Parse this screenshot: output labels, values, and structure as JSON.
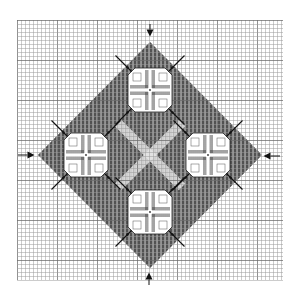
{
  "title": "Needlepoint stitch chart — diamond of four cross motifs",
  "canvas": {
    "width": 296,
    "height": 295,
    "background": "#ffffff"
  },
  "grid": {
    "x0": 17,
    "y0": 20,
    "x1": 283,
    "y1": 280,
    "cell": 4,
    "line_color": "#9a9a9a",
    "major_every": 10,
    "major_color": "#6e6e6e"
  },
  "diamond": {
    "center": [
      150,
      155
    ],
    "top": [
      150,
      42
    ],
    "bottom": [
      150,
      268
    ],
    "left": [
      38,
      155
    ],
    "right": [
      262,
      155
    ],
    "fill": "#8c8c8c",
    "stitch_color": "#3a3a3a",
    "center_cross_color": "#e6e6e6"
  },
  "motifs": [
    {
      "name": "top",
      "cx": 150,
      "cy": 90,
      "size": 44
    },
    {
      "name": "left",
      "cx": 86,
      "cy": 155,
      "size": 44
    },
    {
      "name": "right",
      "cx": 208,
      "cy": 155,
      "size": 44
    },
    {
      "name": "bottom",
      "cx": 150,
      "cy": 212,
      "size": 44
    }
  ],
  "motif_style": {
    "fill": "#ffffff",
    "outline": "#222222",
    "bar_color": "#333333",
    "diagonal_color": "#111111",
    "diagonal_length": 16
  },
  "arrows": [
    {
      "name": "arrow-top",
      "x": 150,
      "y": 33,
      "dir": "down"
    },
    {
      "name": "arrow-left",
      "x": 31,
      "y": 155,
      "dir": "right"
    },
    {
      "name": "arrow-right",
      "x": 267,
      "y": 156,
      "dir": "left"
    },
    {
      "name": "arrow-bottom",
      "x": 149,
      "y": 276,
      "dir": "up"
    }
  ],
  "arrow_color": "#111111"
}
